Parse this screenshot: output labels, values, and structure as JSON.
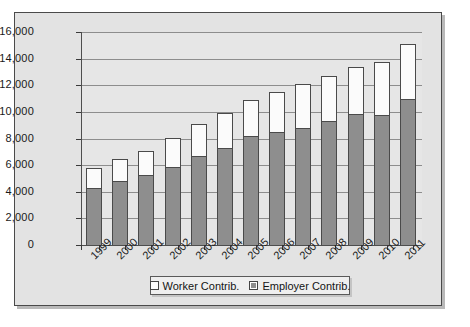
{
  "chart_data": {
    "type": "bar",
    "subtype": "stacked-bar",
    "title": "",
    "xlabel": "",
    "ylabel": "",
    "ylim": [
      0,
      16000
    ],
    "ytick_values": [
      0,
      2000,
      4000,
      6000,
      8000,
      10000,
      12000,
      14000,
      16000
    ],
    "ytick_labels": [
      "0",
      "2,000",
      "4,000",
      "6,000",
      "8,000",
      "10,000",
      "12,000",
      "14,000",
      "16,000"
    ],
    "grid": true,
    "legend_position": "bottom",
    "categories": [
      "1999",
      "2000",
      "2001",
      "2002",
      "2003",
      "2004",
      "2005",
      "2006",
      "2007",
      "2008",
      "2009",
      "2010",
      "2011"
    ],
    "series": [
      {
        "name": "Employer Contrib.",
        "color": "#8e8e8e",
        "values": [
          4247,
          4819,
          5269,
          5866,
          6657,
          7289,
          8167,
          8508,
          8824,
          9325,
          9860,
          9773,
          10944
        ]
      },
      {
        "name": "Worker Contrib.",
        "color": "#fbfbfb",
        "values": [
          1543,
          1619,
          1787,
          2137,
          2412,
          2661,
          2713,
          2973,
          3281,
          3354,
          3515,
          3997,
          4129
        ]
      }
    ],
    "totals": [
      5790,
      6438,
      7056,
      8003,
      9069,
      9950,
      10880,
      11481,
      12105,
      12679,
      13375,
      13770,
      15073
    ],
    "stack_order": [
      "Employer Contrib.",
      "Worker Contrib."
    ]
  },
  "legend": {
    "items": [
      {
        "label": "Worker Contrib.",
        "swatch": "worker-swatch-icon"
      },
      {
        "label": "Employer Contrib.",
        "swatch": "employer-swatch-icon"
      }
    ]
  }
}
